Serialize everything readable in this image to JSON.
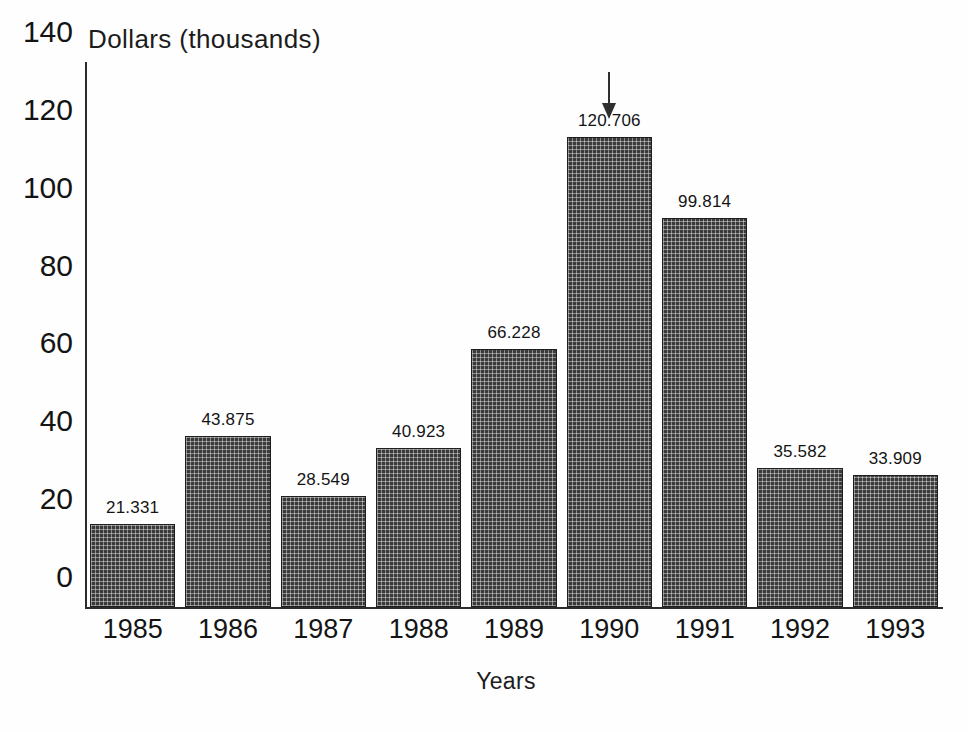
{
  "chart_data": {
    "type": "bar",
    "title": "",
    "subtitle": "",
    "xlabel": "Years",
    "ylabel": "Dollars (thousands)",
    "categories": [
      "1985",
      "1986",
      "1987",
      "1988",
      "1989",
      "1990",
      "1991",
      "1992",
      "1993"
    ],
    "values": [
      21.331,
      43.875,
      28.549,
      40.923,
      66.228,
      120.706,
      99.814,
      35.582,
      33.909
    ],
    "value_labels": [
      "21.331",
      "43.875",
      "28.549",
      "40.923",
      "66.228",
      "120.706",
      "99.814",
      "35.582",
      "33.909"
    ],
    "ylim": [
      0,
      140
    ],
    "ytick_labels": [
      "0",
      "20",
      "40",
      "60",
      "80",
      "100",
      "120",
      "140"
    ],
    "ytick_values": [
      0,
      20,
      40,
      60,
      80,
      100,
      120,
      140
    ],
    "grid": false,
    "legend": null,
    "legend_position": "none",
    "bar_color": "#3a3a3a",
    "bar_edge_color": "#1e1e1e",
    "background_color": "#fefefe",
    "axis_color": "#2b2b2b",
    "annotations": [
      {
        "name": "down-arrow",
        "icon": "arrow-down-icon",
        "target_category": "1990",
        "target_value_label": "120.706"
      }
    ]
  }
}
